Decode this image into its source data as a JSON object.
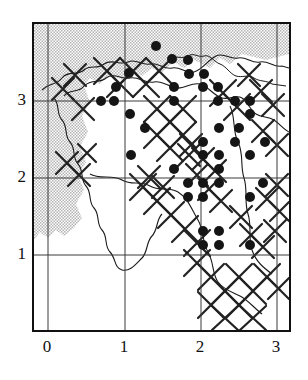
{
  "figure": {
    "name": "species-distribution-map"
  },
  "axes": {
    "x_ticks": [
      "0",
      "1",
      "2",
      "3"
    ],
    "y_ticks": [
      "1",
      "2",
      "3"
    ],
    "x_tick_px": [
      47,
      124,
      200,
      276
    ],
    "y_tick_px": [
      255,
      178,
      101
    ],
    "grid": true,
    "frame": {
      "left": 32,
      "top": 22,
      "width": 259,
      "height": 310
    }
  },
  "colors": {
    "sea_fill": "#c9c9c9",
    "land_fill": "#ffffff",
    "coastline": "#1a1a1a",
    "grid_line": "#3a3a3a",
    "frame_line": "#111111",
    "dot_fill": "#151515",
    "hatch_line": "#222222"
  },
  "chart_data": {
    "type": "scatter",
    "title": "",
    "xlabel": "",
    "ylabel": "",
    "xlim": [
      -0.2,
      3.2
    ],
    "ylim": [
      0.35,
      3.75
    ],
    "grid": true,
    "legend": "none",
    "marker": "filled-circle",
    "marker_size_px": 10,
    "points": [
      {
        "px": 154,
        "py": 44
      },
      {
        "px": 170,
        "py": 57
      },
      {
        "px": 186,
        "py": 58
      },
      {
        "px": 127,
        "py": 71
      },
      {
        "px": 187,
        "py": 72
      },
      {
        "px": 202,
        "py": 72
      },
      {
        "px": 114,
        "py": 85
      },
      {
        "px": 172,
        "py": 85
      },
      {
        "px": 201,
        "py": 85
      },
      {
        "px": 216,
        "py": 85
      },
      {
        "px": 99,
        "py": 99
      },
      {
        "px": 112,
        "py": 99
      },
      {
        "px": 172,
        "py": 99
      },
      {
        "px": 216,
        "py": 99
      },
      {
        "px": 233,
        "py": 99
      },
      {
        "px": 248,
        "py": 99
      },
      {
        "px": 128,
        "py": 112
      },
      {
        "px": 248,
        "py": 112
      },
      {
        "px": 143,
        "py": 126
      },
      {
        "px": 217,
        "py": 126
      },
      {
        "px": 237,
        "py": 126
      },
      {
        "px": 201,
        "py": 140
      },
      {
        "px": 233,
        "py": 140
      },
      {
        "px": 263,
        "py": 140
      },
      {
        "px": 129,
        "py": 153
      },
      {
        "px": 201,
        "py": 153
      },
      {
        "px": 217,
        "py": 153
      },
      {
        "px": 248,
        "py": 153
      },
      {
        "px": 172,
        "py": 167
      },
      {
        "px": 217,
        "py": 167
      },
      {
        "px": 186,
        "py": 181
      },
      {
        "px": 201,
        "py": 181
      },
      {
        "px": 217,
        "py": 181
      },
      {
        "px": 261,
        "py": 181
      },
      {
        "px": 186,
        "py": 195
      },
      {
        "px": 201,
        "py": 195
      },
      {
        "px": 248,
        "py": 195
      },
      {
        "px": 201,
        "py": 229
      },
      {
        "px": 217,
        "py": 229
      },
      {
        "px": 201,
        "py": 243
      },
      {
        "px": 217,
        "py": 243
      },
      {
        "px": 248,
        "py": 243
      }
    ],
    "point_count": 42
  }
}
